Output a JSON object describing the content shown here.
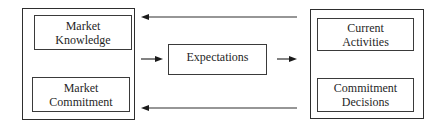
{
  "diagram": {
    "state_aspects": {
      "market_knowledge": [
        "Market",
        "Knowledge"
      ],
      "market_commitment": [
        "Market",
        "Commitment"
      ]
    },
    "center": {
      "expectations": "Expectations"
    },
    "change_aspects": {
      "current_activities": [
        "Current",
        "Activities"
      ],
      "commitment_decisions": [
        "Commitment",
        "Decisions"
      ]
    },
    "arrows": [
      {
        "from": "change-aspects",
        "to": "state-aspects",
        "row": "top",
        "direction": "left"
      },
      {
        "from": "state-aspects",
        "to": "expectations",
        "row": "middle",
        "direction": "right"
      },
      {
        "from": "expectations",
        "to": "change-aspects",
        "row": "middle",
        "direction": "right"
      },
      {
        "from": "change-aspects",
        "to": "state-aspects",
        "row": "bottom",
        "direction": "left"
      }
    ],
    "line_color": "#2e2e2e"
  }
}
